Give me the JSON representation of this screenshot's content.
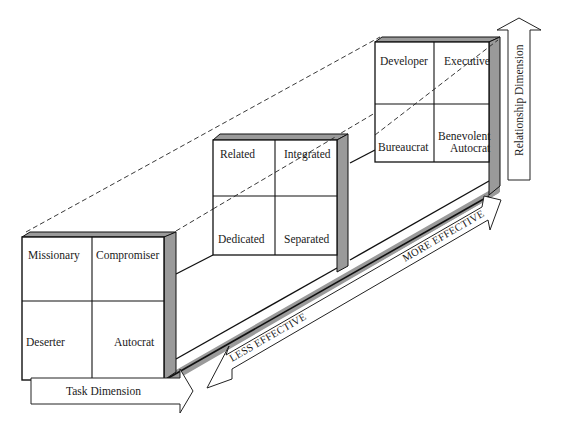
{
  "diagram": {
    "type": "3d-leadership-effectiveness-model",
    "colors": {
      "line": "#111111",
      "shade": "#9a9a9a",
      "background": "#ffffff"
    },
    "grids": {
      "less_effective": {
        "cells": {
          "top_left": "Missionary",
          "top_right": "Compromiser",
          "bottom_left": "Deserter",
          "bottom_right": "Autocrat"
        }
      },
      "basic": {
        "cells": {
          "top_left": "Related",
          "top_right": "Integrated",
          "bottom_left": "Dedicated",
          "bottom_right": "Separated"
        }
      },
      "more_effective": {
        "cells": {
          "top_left": "Developer",
          "top_right": "Executive",
          "bottom_left": "Bureaucrat",
          "bottom_right_line1": "Benevolent",
          "bottom_right_line2": "Autocrat"
        }
      }
    },
    "axes": {
      "task": "Task Dimension",
      "relationship": "Relationship Dimension"
    },
    "effectiveness": {
      "less": "LESS EFFECTIVE",
      "more": "MORE EFFECTIVE"
    }
  }
}
